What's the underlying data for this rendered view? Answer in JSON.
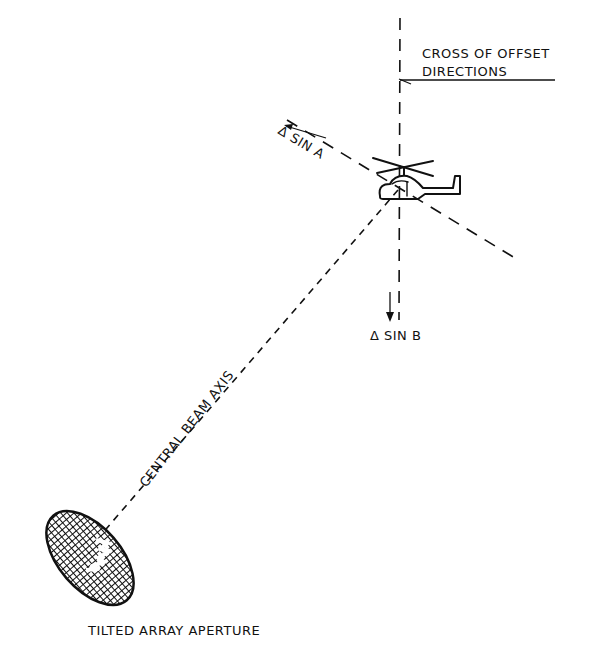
{
  "diagram": {
    "labels": {
      "cross_line1": "CROSS OF OFFSET",
      "cross_line2": "DIRECTIONS",
      "delta_sin_a": "Δ SIN A",
      "delta_sin_b": "Δ SIN B",
      "central_beam_axis": "CENTRAL  BEAM  AXIS",
      "tilted_array_aperture": "TILTED  ARRAY  APERTURE"
    },
    "elements": {
      "target": "helicopter-icon",
      "aperture": "hatched-ellipse",
      "axes": [
        "vertical-offset-axis",
        "diagonal-offset-axis",
        "central-beam-axis"
      ]
    },
    "colors": {
      "ink": "#111111",
      "background": "#ffffff"
    }
  }
}
